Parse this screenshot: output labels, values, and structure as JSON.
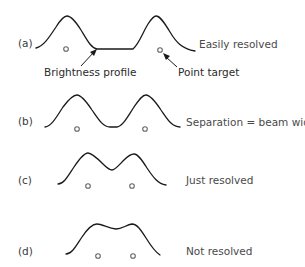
{
  "diagram": {
    "panels": [
      {
        "id": "a",
        "label": "(a)",
        "description": "Easily resolved"
      },
      {
        "id": "b",
        "label": "(b)",
        "description": "Separation = beam width"
      },
      {
        "id": "c",
        "label": "(c)",
        "description": "Just resolved"
      },
      {
        "id": "d",
        "label": "(d)",
        "description": "Not resolved"
      }
    ],
    "annotations": {
      "brightness_profile": "Brightness profile",
      "point_target": "Point target"
    }
  }
}
